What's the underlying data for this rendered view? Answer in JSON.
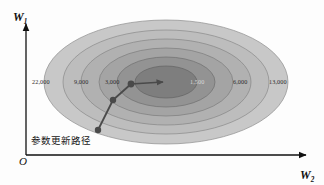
{
  "figure": {
    "kind": "contour-plot",
    "background_color": "#fdfdfd",
    "axes": {
      "y_axis_label": "W",
      "y_axis_sub": "1",
      "x_axis_label": "W",
      "x_axis_sub": "2",
      "origin_label": "O",
      "axis_color": "#111111"
    },
    "path_caption": "参数更新路径"
  },
  "chart_data": {
    "type": "contour",
    "title": "",
    "xlabel": "W2",
    "ylabel": "W1",
    "annotations": [
      "参数更新路径"
    ],
    "contour_labels": [
      {
        "value": "22,000",
        "x": 32,
        "y": 79,
        "side": "left",
        "on_dark": false
      },
      {
        "value": "9,000",
        "x": 74,
        "y": 79,
        "side": "left",
        "on_dark": false
      },
      {
        "value": "3,000",
        "x": 105,
        "y": 79,
        "side": "left",
        "on_dark": false
      },
      {
        "value": "1,500",
        "x": 190,
        "y": 79,
        "side": "right",
        "on_dark": true
      },
      {
        "value": "6,000",
        "x": 233,
        "y": 79,
        "side": "right",
        "on_dark": false
      },
      {
        "value": "13,000",
        "x": 269,
        "y": 79,
        "side": "right",
        "on_dark": false
      }
    ],
    "contour_levels": [
      22000,
      13000,
      9000,
      6000,
      3000,
      1500
    ],
    "ellipses": [
      {
        "level": 22000,
        "rx": 122,
        "ry": 62,
        "fill": "#c6c6c6"
      },
      {
        "level": 13000,
        "rx": 103,
        "ry": 52,
        "fill": "#bcbcbc"
      },
      {
        "level": 9000,
        "rx": 85,
        "ry": 43,
        "fill": "#b1b1b1"
      },
      {
        "level": 6000,
        "rx": 67,
        "ry": 34,
        "fill": "#a4a4a4"
      },
      {
        "level": 3000,
        "rx": 49,
        "ry": 25,
        "fill": "#949494"
      },
      {
        "level": 1500,
        "rx": 31,
        "ry": 16,
        "fill": "#7f7f7f"
      }
    ],
    "center": {
      "x": 166,
      "y": 82
    },
    "descent_path": {
      "marker_color": "#4a4a4a",
      "line_color": "#4a4a4a",
      "points": [
        {
          "x": 98,
          "y": 130,
          "marker": true
        },
        {
          "x": 113,
          "y": 100,
          "marker": true
        },
        {
          "x": 131,
          "y": 84,
          "marker": true
        },
        {
          "x": 166,
          "y": 82,
          "marker": false,
          "arrow": true
        }
      ]
    }
  }
}
